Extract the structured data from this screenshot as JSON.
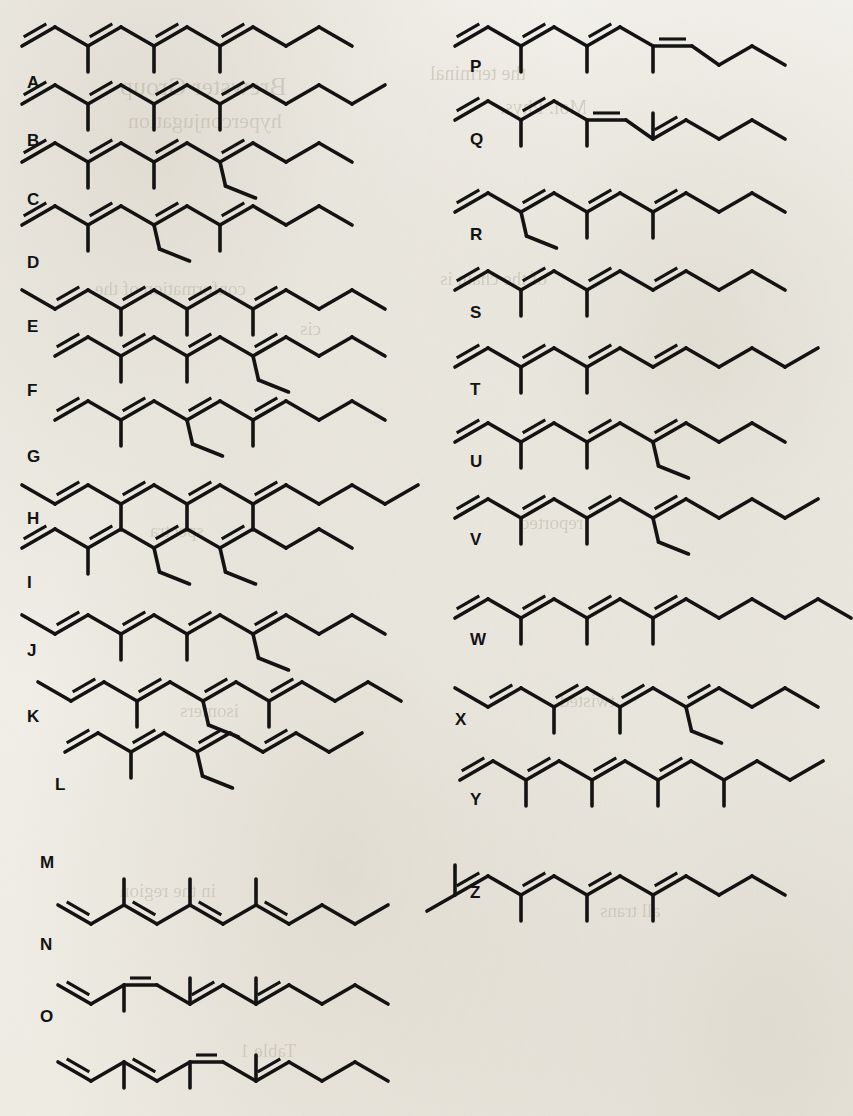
{
  "figure": {
    "type": "chemical-structure-panel",
    "label_count": 26,
    "ink_color": "#131313",
    "paper_color": "#f3f1ec",
    "columns": 2,
    "left_column_labels": [
      "A",
      "B",
      "C",
      "D",
      "E",
      "F",
      "G",
      "H",
      "I",
      "J",
      "K",
      "L",
      "M",
      "N",
      "O"
    ],
    "right_column_labels": [
      "P",
      "Q",
      "R",
      "S",
      "T",
      "U",
      "V",
      "W",
      "X",
      "Y",
      "Z"
    ]
  },
  "ghost_text": [
    {
      "text": "Brewster Group",
      "x": 120,
      "y": 72,
      "size": 26
    },
    {
      "text": "hyperconjugation",
      "x": 128,
      "y": 108,
      "size": 22
    },
    {
      "text": "the terminal",
      "x": 430,
      "y": 62,
      "size": 20
    },
    {
      "text": "Mol. Phys.",
      "x": 500,
      "y": 96,
      "size": 20
    },
    {
      "text": "conformation of the",
      "x": 95,
      "y": 278,
      "size": 19
    },
    {
      "text": "of the chain is",
      "x": 440,
      "y": 268,
      "size": 19
    },
    {
      "text": "cis",
      "x": 300,
      "y": 318,
      "size": 19
    },
    {
      "text": "spectra",
      "x": 150,
      "y": 520,
      "size": 19
    },
    {
      "text": "reported",
      "x": 520,
      "y": 512,
      "size": 19
    },
    {
      "text": "isomers",
      "x": 180,
      "y": 700,
      "size": 19
    },
    {
      "text": "twisted",
      "x": 560,
      "y": 690,
      "size": 19
    },
    {
      "text": "in the region",
      "x": 120,
      "y": 880,
      "size": 19
    },
    {
      "text": "all trans",
      "x": 600,
      "y": 900,
      "size": 19
    },
    {
      "text": "Table 1",
      "x": 240,
      "y": 1040,
      "size": 19
    }
  ],
  "structures": [
    {
      "label": "A",
      "label_x": 27,
      "label_y": 88,
      "origin_x": 22,
      "origin_y": 46,
      "pattern": "chain-9-up-start",
      "vertices": 11,
      "start_dir": "up",
      "substituents": [
        {
          "at": 2,
          "type": "methyl",
          "dir": "down"
        },
        {
          "at": 4,
          "type": "methyl",
          "dir": "down"
        },
        {
          "at": 6,
          "type": "methyl",
          "dir": "down"
        }
      ],
      "double_bonds": [
        [
          1,
          2
        ],
        [
          3,
          4
        ],
        [
          5,
          6
        ],
        [
          7,
          8
        ]
      ],
      "tail": "up-end"
    },
    {
      "label": "B",
      "label_x": 27,
      "label_y": 146,
      "origin_x": 22,
      "origin_y": 104,
      "vertices": 12,
      "substituents": [
        {
          "at": 2,
          "type": "methyl",
          "dir": "down"
        },
        {
          "at": 4,
          "type": "methyl",
          "dir": "down"
        },
        {
          "at": 6,
          "type": "methyl",
          "dir": "down"
        }
      ],
      "double_bonds": [
        [
          1,
          2
        ],
        [
          3,
          4
        ],
        [
          5,
          6
        ],
        [
          7,
          8
        ]
      ]
    },
    {
      "label": "C",
      "label_x": 27,
      "label_y": 205,
      "origin_x": 22,
      "origin_y": 162,
      "vertices": 11,
      "substituents": [
        {
          "at": 2,
          "type": "methyl",
          "dir": "down"
        },
        {
          "at": 4,
          "type": "methyl",
          "dir": "down"
        },
        {
          "at": 6,
          "type": "ethyl",
          "dir": "down"
        }
      ],
      "double_bonds": [
        [
          1,
          2
        ],
        [
          3,
          4
        ],
        [
          5,
          6
        ],
        [
          7,
          8
        ]
      ]
    },
    {
      "label": "D",
      "label_x": 27,
      "label_y": 268,
      "origin_x": 22,
      "origin_y": 225,
      "vertices": 11,
      "substituents": [
        {
          "at": 2,
          "type": "methyl",
          "dir": "down"
        },
        {
          "at": 4,
          "type": "ethyl",
          "dir": "down"
        },
        {
          "at": 6,
          "type": "methyl",
          "dir": "down"
        }
      ],
      "double_bonds": [
        [
          1,
          2
        ],
        [
          3,
          4
        ],
        [
          5,
          6
        ],
        [
          7,
          8
        ]
      ]
    },
    {
      "label": "E",
      "label_x": 27,
      "label_y": 332,
      "origin_x": 22,
      "origin_y": 290,
      "vertices": 12,
      "start_dir": "down",
      "substituents": [
        {
          "at": 3,
          "type": "methyl",
          "dir": "down"
        },
        {
          "at": 5,
          "type": "methyl",
          "dir": "down"
        },
        {
          "at": 7,
          "type": "methyl",
          "dir": "down"
        }
      ],
      "double_bonds": [
        [
          2,
          3
        ],
        [
          4,
          5
        ],
        [
          6,
          7
        ],
        [
          8,
          9
        ]
      ]
    },
    {
      "label": "F",
      "label_x": 27,
      "label_y": 396,
      "origin_x": 55,
      "origin_y": 356,
      "vertices": 11,
      "substituents": [
        {
          "at": 2,
          "type": "methyl",
          "dir": "down"
        },
        {
          "at": 4,
          "type": "methyl",
          "dir": "down"
        },
        {
          "at": 6,
          "type": "ethyl",
          "dir": "down"
        }
      ],
      "double_bonds": [
        [
          1,
          2
        ],
        [
          3,
          4
        ],
        [
          5,
          6
        ],
        [
          7,
          8
        ]
      ]
    },
    {
      "label": "G",
      "label_x": 27,
      "label_y": 462,
      "origin_x": 55,
      "origin_y": 420,
      "vertices": 11,
      "substituents": [
        {
          "at": 2,
          "type": "methyl",
          "dir": "down"
        },
        {
          "at": 4,
          "type": "ethyl",
          "dir": "down"
        },
        {
          "at": 6,
          "type": "methyl",
          "dir": "down"
        }
      ],
      "double_bonds": [
        [
          1,
          2
        ],
        [
          3,
          4
        ],
        [
          5,
          6
        ],
        [
          7,
          8
        ]
      ]
    },
    {
      "label": "H",
      "label_x": 27,
      "label_y": 524,
      "origin_x": 22,
      "origin_y": 485,
      "vertices": 13,
      "start_dir": "down",
      "substituents": [
        {
          "at": 3,
          "type": "methyl",
          "dir": "down"
        },
        {
          "at": 5,
          "type": "methyl",
          "dir": "down"
        },
        {
          "at": 7,
          "type": "methyl",
          "dir": "down"
        }
      ],
      "double_bonds": [
        [
          2,
          3
        ],
        [
          4,
          5
        ],
        [
          6,
          7
        ],
        [
          8,
          9
        ]
      ]
    },
    {
      "label": "I",
      "label_x": 27,
      "label_y": 588,
      "origin_x": 22,
      "origin_y": 548,
      "vertices": 11,
      "substituents": [
        {
          "at": 2,
          "type": "methyl",
          "dir": "down"
        },
        {
          "at": 4,
          "type": "ethyl",
          "dir": "down"
        },
        {
          "at": 6,
          "type": "ethyl",
          "dir": "down"
        }
      ],
      "double_bonds": [
        [
          1,
          2
        ],
        [
          3,
          4
        ],
        [
          5,
          6
        ],
        [
          7,
          8
        ]
      ]
    },
    {
      "label": "J",
      "label_x": 27,
      "label_y": 656,
      "origin_x": 22,
      "origin_y": 615,
      "vertices": 12,
      "start_dir": "down",
      "substituents": [
        {
          "at": 3,
          "type": "methyl",
          "dir": "down"
        },
        {
          "at": 5,
          "type": "methyl",
          "dir": "down"
        },
        {
          "at": 7,
          "type": "ethyl",
          "dir": "down"
        }
      ],
      "double_bonds": [
        [
          2,
          3
        ],
        [
          4,
          5
        ],
        [
          6,
          7
        ],
        [
          8,
          9
        ]
      ]
    },
    {
      "label": "K",
      "label_x": 27,
      "label_y": 722,
      "origin_x": 38,
      "origin_y": 682,
      "vertices": 12,
      "start_dir": "down",
      "substituents": [
        {
          "at": 3,
          "type": "methyl",
          "dir": "down"
        },
        {
          "at": 5,
          "type": "ethyl",
          "dir": "down"
        },
        {
          "at": 7,
          "type": "methyl",
          "dir": "down"
        }
      ],
      "double_bonds": [
        [
          2,
          3
        ],
        [
          4,
          5
        ],
        [
          6,
          7
        ],
        [
          8,
          9
        ]
      ]
    },
    {
      "label": "L",
      "label_x": 55,
      "label_y": 790,
      "origin_x": 65,
      "origin_y": 752,
      "vertices": 10,
      "substituents": [
        {
          "at": 2,
          "type": "methyl",
          "dir": "down"
        },
        {
          "at": 4,
          "type": "ethyl",
          "dir": "down"
        }
      ],
      "double_bonds": [
        [
          1,
          2
        ],
        [
          3,
          4
        ],
        [
          5,
          6
        ],
        [
          7,
          8
        ]
      ]
    },
    {
      "label": "M",
      "label_x": 40,
      "label_y": 868,
      "origin_x": 58,
      "origin_y": 905,
      "inverted": true,
      "vertices": 11,
      "substituents": [
        {
          "at": 2,
          "type": "methyl",
          "dir": "up"
        },
        {
          "at": 4,
          "type": "methyl",
          "dir": "up"
        },
        {
          "at": 6,
          "type": "methyl",
          "dir": "up"
        }
      ],
      "double_bonds": [
        [
          1,
          2
        ],
        [
          3,
          4
        ],
        [
          5,
          6
        ],
        [
          7,
          8
        ]
      ],
      "first_bond_style": "cis-flat"
    },
    {
      "label": "N",
      "label_x": 40,
      "label_y": 950,
      "origin_x": 58,
      "origin_y": 985,
      "inverted": true,
      "vertices": 11,
      "substituents": [
        {
          "at": 2,
          "type": "methyl",
          "dir": "down"
        },
        {
          "at": 4,
          "type": "methyl",
          "dir": "up"
        },
        {
          "at": 6,
          "type": "methyl",
          "dir": "up"
        }
      ],
      "double_bonds": [
        [
          1,
          2
        ],
        [
          3,
          4
        ],
        [
          5,
          6
        ],
        [
          7,
          8
        ]
      ],
      "flat_bond": [
        3,
        4
      ]
    },
    {
      "label": "O",
      "label_x": 40,
      "label_y": 1022,
      "origin_x": 58,
      "origin_y": 1062,
      "inverted": true,
      "vertices": 11,
      "substituents": [
        {
          "at": 2,
          "type": "methyl",
          "dir": "down"
        },
        {
          "at": 4,
          "type": "methyl",
          "dir": "down"
        },
        {
          "at": 6,
          "type": "methyl",
          "dir": "up"
        }
      ],
      "double_bonds": [
        [
          1,
          2
        ],
        [
          3,
          4
        ],
        [
          5,
          6
        ],
        [
          7,
          8
        ]
      ],
      "flat_bond": [
        5,
        6
      ]
    },
    {
      "label": "P",
      "label_x": 470,
      "label_y": 72,
      "origin_x": 455,
      "origin_y": 46,
      "vertices": 11,
      "substituents": [
        {
          "at": 2,
          "type": "methyl",
          "dir": "down"
        },
        {
          "at": 4,
          "type": "methyl",
          "dir": "down"
        },
        {
          "at": 6,
          "type": "methyl",
          "dir": "down"
        }
      ],
      "double_bonds": [
        [
          1,
          2
        ],
        [
          3,
          4
        ],
        [
          5,
          6
        ]
      ],
      "cis_bond": [
        7,
        8
      ]
    },
    {
      "label": "Q",
      "label_x": 470,
      "label_y": 145,
      "origin_x": 455,
      "origin_y": 120,
      "vertices": 11,
      "substituents": [
        {
          "at": 2,
          "type": "methyl",
          "dir": "down"
        },
        {
          "at": 4,
          "type": "methyl",
          "dir": "down"
        },
        {
          "at": 6,
          "type": "methyl",
          "dir": "up"
        }
      ],
      "double_bonds": [
        [
          1,
          2
        ],
        [
          3,
          4
        ],
        [
          7,
          8
        ]
      ],
      "cis_bond": [
        5,
        6
      ]
    },
    {
      "label": "R",
      "label_x": 470,
      "label_y": 240,
      "origin_x": 455,
      "origin_y": 212,
      "vertices": 11,
      "substituents": [
        {
          "at": 2,
          "type": "ethyl",
          "dir": "down"
        },
        {
          "at": 4,
          "type": "methyl",
          "dir": "down"
        },
        {
          "at": 6,
          "type": "methyl",
          "dir": "down"
        }
      ],
      "double_bonds": [
        [
          1,
          2
        ],
        [
          3,
          4
        ],
        [
          5,
          6
        ],
        [
          7,
          8
        ]
      ]
    },
    {
      "label": "S",
      "label_x": 470,
      "label_y": 318,
      "origin_x": 455,
      "origin_y": 290,
      "vertices": 11,
      "substituents": [
        {
          "at": 2,
          "type": "methyl",
          "dir": "down"
        },
        {
          "at": 4,
          "type": "methyl",
          "dir": "down"
        }
      ],
      "double_bonds": [
        [
          1,
          2
        ],
        [
          3,
          4
        ],
        [
          5,
          6
        ],
        [
          7,
          8
        ]
      ]
    },
    {
      "label": "T",
      "label_x": 470,
      "label_y": 395,
      "origin_x": 455,
      "origin_y": 367,
      "vertices": 12,
      "substituents": [
        {
          "at": 2,
          "type": "methyl",
          "dir": "down"
        },
        {
          "at": 4,
          "type": "methyl",
          "dir": "down"
        }
      ],
      "double_bonds": [
        [
          1,
          2
        ],
        [
          3,
          4
        ],
        [
          5,
          6
        ],
        [
          7,
          8
        ]
      ]
    },
    {
      "label": "U",
      "label_x": 470,
      "label_y": 467,
      "origin_x": 455,
      "origin_y": 442,
      "vertices": 11,
      "substituents": [
        {
          "at": 2,
          "type": "methyl",
          "dir": "down"
        },
        {
          "at": 4,
          "type": "methyl",
          "dir": "down"
        },
        {
          "at": 6,
          "type": "ethyl",
          "dir": "down"
        }
      ],
      "double_bonds": [
        [
          1,
          2
        ],
        [
          3,
          4
        ],
        [
          5,
          6
        ],
        [
          7,
          8
        ]
      ]
    },
    {
      "label": "V",
      "label_x": 470,
      "label_y": 545,
      "origin_x": 455,
      "origin_y": 518,
      "vertices": 12,
      "substituents": [
        {
          "at": 2,
          "type": "methyl",
          "dir": "down"
        },
        {
          "at": 4,
          "type": "methyl",
          "dir": "down"
        },
        {
          "at": 6,
          "type": "ethyl",
          "dir": "down"
        }
      ],
      "double_bonds": [
        [
          1,
          2
        ],
        [
          3,
          4
        ],
        [
          5,
          6
        ],
        [
          7,
          8
        ]
      ]
    },
    {
      "label": "W",
      "label_x": 470,
      "label_y": 645,
      "origin_x": 455,
      "origin_y": 618,
      "vertices": 13,
      "substituents": [
        {
          "at": 2,
          "type": "methyl",
          "dir": "down"
        },
        {
          "at": 4,
          "type": "methyl",
          "dir": "down"
        },
        {
          "at": 6,
          "type": "methyl",
          "dir": "down"
        }
      ],
      "double_bonds": [
        [
          1,
          2
        ],
        [
          3,
          4
        ],
        [
          5,
          6
        ],
        [
          7,
          8
        ]
      ]
    },
    {
      "label": "X",
      "label_x": 455,
      "label_y": 725,
      "origin_x": 455,
      "origin_y": 688,
      "vertices": 12,
      "start_dir": "down",
      "substituents": [
        {
          "at": 3,
          "type": "methyl",
          "dir": "down"
        },
        {
          "at": 5,
          "type": "methyl",
          "dir": "down"
        },
        {
          "at": 7,
          "type": "ethyl",
          "dir": "down"
        }
      ],
      "double_bonds": [
        [
          2,
          3
        ],
        [
          4,
          5
        ],
        [
          6,
          7
        ],
        [
          8,
          9
        ]
      ]
    },
    {
      "label": "Y",
      "label_x": 470,
      "label_y": 805,
      "origin_x": 460,
      "origin_y": 780,
      "vertices": 12,
      "substituents": [
        {
          "at": 2,
          "type": "methyl",
          "dir": "down"
        },
        {
          "at": 4,
          "type": "methyl",
          "dir": "down"
        },
        {
          "at": 6,
          "type": "methyl",
          "dir": "down"
        },
        {
          "at": 8,
          "type": "methyl",
          "dir": "down"
        }
      ],
      "double_bonds": [
        [
          1,
          2
        ],
        [
          3,
          4
        ],
        [
          5,
          6
        ],
        [
          7,
          8
        ]
      ]
    },
    {
      "label": "Z",
      "label_x": 470,
      "label_y": 898,
      "origin_x": 455,
      "origin_y": 895,
      "vertices": 11,
      "start_dir": "up",
      "gem_dimethyl_start": true,
      "substituents": [
        {
          "at": 2,
          "type": "methyl",
          "dir": "down"
        },
        {
          "at": 4,
          "type": "methyl",
          "dir": "down"
        },
        {
          "at": 6,
          "type": "methyl",
          "dir": "down"
        }
      ],
      "double_bonds": [
        [
          1,
          2
        ],
        [
          3,
          4
        ],
        [
          5,
          6
        ],
        [
          7,
          8
        ]
      ]
    }
  ],
  "geometry": {
    "bond_dx": 33,
    "bond_dy": 19,
    "methyl_len": 26,
    "ethyl_dx": 22,
    "ethyl_dy": 24,
    "double_offset": 7,
    "stroke_width": 3.6
  }
}
